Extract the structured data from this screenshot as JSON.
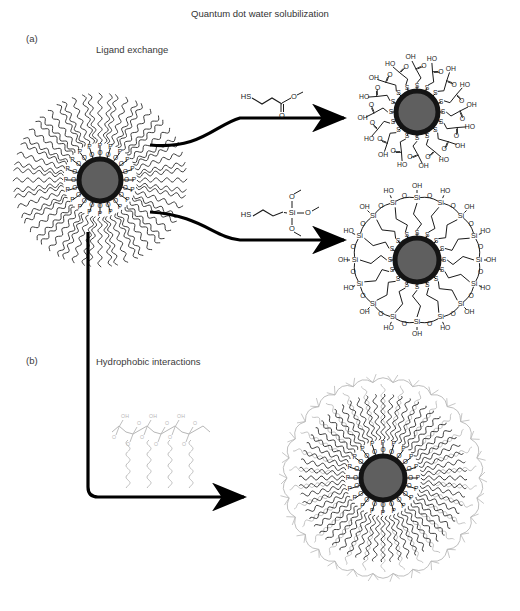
{
  "figure": {
    "title": "Quantum dot water solubilization",
    "panels": [
      {
        "id": "a",
        "label": "(a)",
        "caption": "Ligand exchange",
        "routes": [
          {
            "name": "thiol-carboxyl-exchange",
            "reagent": {
              "name": "mercaptoacetic-acid",
              "atoms": [
                "HS",
                "O",
                "O"
              ],
              "labels": {
                "thiol": "HS",
                "carbonyl": "O",
                "hydroxyl": "O"
              }
            },
            "product": {
              "name": "carboxyl-capped-quantum-dot",
              "ligand_count": 16,
              "surface_atom": "S",
              "terminal_groups": [
                "OH",
                "O",
                "HO"
              ]
            }
          },
          {
            "name": "silane-exchange",
            "reagent": {
              "name": "mercaptopropyl-trimethoxysilane",
              "atoms": [
                "HS",
                "Si",
                "O",
                "O",
                "O"
              ],
              "labels": {
                "thiol": "HS",
                "silicon": "Si",
                "methoxy": "O"
              }
            },
            "product": {
              "name": "silica-shell-quantum-dot",
              "ligand_count": 16,
              "surface_atom": "S",
              "shell_atoms": [
                "Si",
                "O"
              ],
              "terminal_groups": [
                "OH",
                "HO"
              ]
            }
          }
        ]
      },
      {
        "id": "b",
        "label": "(b)",
        "caption": "Hydrophobic interactions",
        "routes": [
          {
            "name": "amphiphilic-polymer-coating",
            "reagent": {
              "name": "amphiphilic-polymer",
              "description": "polymer backbone with pendant alkyl chains"
            },
            "product": {
              "name": "polymer-encapsulated-quantum-dot",
              "ligand_count": 20,
              "surface_atoms": [
                "O",
                "P"
              ],
              "shell": "amphiphilic polymer"
            }
          }
        ]
      }
    ],
    "source_particle": {
      "name": "topo-capped-quantum-dot",
      "ligand_count": 20,
      "surface_atoms": [
        "O",
        "P"
      ],
      "core_color": "#5f5f5f",
      "shell_color": "#141414"
    },
    "colors": {
      "core_fill": "#5f5f5f",
      "core_ring": "#141414",
      "ligand": "#1a1a1a",
      "polymer": "#b7b7b7",
      "text": "#3a3a3a",
      "arrow": "#000000"
    },
    "atom_labels": {
      "sulfur": "S",
      "oxygen": "O",
      "phosphorus": "P",
      "silicon": "Si",
      "hydroxyl": "OH",
      "hydroxyl_rev": "HO",
      "thiol": "HS"
    }
  }
}
